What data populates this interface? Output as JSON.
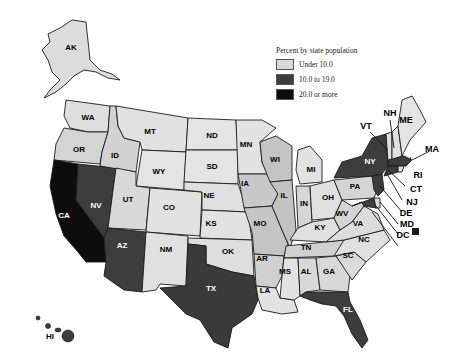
{
  "legend": {
    "title": "Percent by state population",
    "items": [
      {
        "label": "Under 10.0",
        "color": "#d9d9d9"
      },
      {
        "label": "10.0 to 19.0",
        "color": "#3d3d3d"
      },
      {
        "label": "20.0 or more",
        "color": "#0d0d0d"
      }
    ]
  },
  "categories": {
    "under_10": [
      "AK",
      "WA",
      "OR",
      "ID",
      "MT",
      "WY",
      "UT",
      "CO",
      "NM",
      "ND",
      "SD",
      "NE",
      "KS",
      "OK",
      "MN",
      "IA",
      "MO",
      "AR",
      "LA",
      "WI",
      "IL",
      "MI",
      "IN",
      "OH",
      "KY",
      "TN",
      "MS",
      "AL",
      "GA",
      "SC",
      "NC",
      "VA",
      "WV",
      "PA",
      "VT",
      "NH",
      "ME",
      "RI",
      "DE"
    ],
    "10_to_19": [
      "NV",
      "AZ",
      "TX",
      "FL",
      "NY",
      "MA",
      "CT",
      "NJ",
      "MD",
      "DC",
      "HI"
    ],
    "20_or_more": [
      "CA"
    ]
  },
  "labels": {
    "AK": "AK",
    "WA": "WA",
    "OR": "OR",
    "ID": "ID",
    "MT": "MT",
    "WY": "WY",
    "UT": "UT",
    "CO": "CO",
    "NM": "NM",
    "AZ": "AZ",
    "NV": "NV",
    "CA": "CA",
    "ND": "ND",
    "SD": "SD",
    "NE": "NE",
    "KS": "KS",
    "OK": "OK",
    "TX": "TX",
    "MN": "MN",
    "IA": "IA",
    "MO": "MO",
    "AR": "AR",
    "LA": "LA",
    "WI": "WI",
    "IL": "IL",
    "MI": "MI",
    "IN": "IN",
    "OH": "OH",
    "KY": "KY",
    "TN": "TN",
    "MS": "MS",
    "AL": "AL",
    "GA": "GA",
    "FL": "FL",
    "SC": "SC",
    "NC": "NC",
    "VA": "VA",
    "WV": "WV",
    "PA": "PA",
    "NY": "NY",
    "VT": "VT",
    "NH": "NH",
    "ME": "ME",
    "MA": "MA",
    "RI": "RI",
    "CT": "CT",
    "NJ": "NJ",
    "DE": "DE",
    "MD": "MD",
    "DC": "DC",
    "HI": "HI"
  }
}
